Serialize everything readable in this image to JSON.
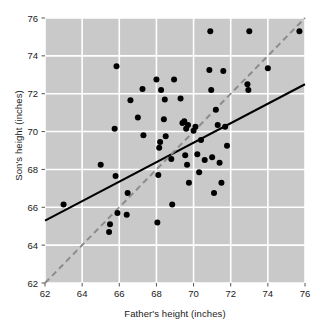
{
  "chart_data": {
    "type": "scatter",
    "title": "",
    "xlabel": "Father's height (inches)",
    "ylabel": "Son's height (inches)",
    "xlim": [
      62,
      76
    ],
    "ylim": [
      62,
      76
    ],
    "xticks": [
      62,
      64,
      66,
      68,
      70,
      72,
      74,
      76
    ],
    "yticks": [
      62,
      64,
      66,
      68,
      70,
      72,
      74,
      76
    ],
    "grid": true,
    "legend": "none",
    "plot_bgcolor": "#c9c9c9",
    "grid_color": "#ffffff",
    "point_color": "#000000",
    "point_radius_px": 3.0,
    "series": [
      {
        "name": "father-son heights",
        "marker": "filled-circle",
        "points": [
          [
            63.0,
            66.15
          ],
          [
            65.0,
            68.25
          ],
          [
            65.45,
            64.7
          ],
          [
            65.5,
            65.1
          ],
          [
            65.75,
            70.15
          ],
          [
            65.8,
            67.65
          ],
          [
            65.85,
            73.45
          ],
          [
            65.9,
            65.7
          ],
          [
            66.4,
            65.6
          ],
          [
            66.45,
            66.75
          ],
          [
            66.6,
            71.65
          ],
          [
            67.0,
            70.75
          ],
          [
            67.25,
            72.25
          ],
          [
            67.3,
            69.8
          ],
          [
            68.0,
            72.75
          ],
          [
            68.05,
            65.2
          ],
          [
            68.1,
            67.7
          ],
          [
            68.15,
            69.15
          ],
          [
            68.2,
            69.45
          ],
          [
            68.25,
            72.2
          ],
          [
            68.4,
            70.65
          ],
          [
            68.45,
            71.7
          ],
          [
            68.5,
            69.75
          ],
          [
            68.8,
            68.55
          ],
          [
            68.85,
            66.15
          ],
          [
            68.95,
            72.75
          ],
          [
            69.3,
            71.75
          ],
          [
            69.4,
            70.45
          ],
          [
            69.5,
            70.55
          ],
          [
            69.55,
            68.75
          ],
          [
            69.6,
            70.15
          ],
          [
            69.65,
            68.25
          ],
          [
            69.7,
            70.35
          ],
          [
            69.75,
            67.3
          ],
          [
            70.0,
            70.05
          ],
          [
            70.1,
            70.25
          ],
          [
            70.2,
            68.8
          ],
          [
            70.3,
            67.85
          ],
          [
            70.4,
            69.55
          ],
          [
            70.6,
            68.5
          ],
          [
            70.85,
            73.25
          ],
          [
            70.9,
            75.3
          ],
          [
            70.95,
            72.2
          ],
          [
            71.0,
            68.65
          ],
          [
            71.1,
            66.75
          ],
          [
            71.2,
            71.15
          ],
          [
            71.3,
            70.35
          ],
          [
            71.4,
            68.35
          ],
          [
            71.5,
            67.3
          ],
          [
            71.6,
            73.2
          ],
          [
            71.7,
            70.25
          ],
          [
            71.8,
            69.25
          ],
          [
            72.9,
            72.5
          ],
          [
            72.95,
            72.2
          ],
          [
            73.0,
            75.3
          ],
          [
            74.0,
            73.35
          ],
          [
            75.7,
            75.3
          ]
        ]
      }
    ],
    "lines": [
      {
        "name": "regression-line",
        "style": "solid",
        "color": "#000000",
        "width_px": 2.0,
        "x0": 62.0,
        "y0": 65.3,
        "x1": 76.0,
        "y1": 72.5
      },
      {
        "name": "identity-line",
        "style": "dashed",
        "color": "#8c8c8c",
        "width_px": 2.0,
        "x0": 62.0,
        "y0": 62.0,
        "x1": 76.0,
        "y1": 76.0
      }
    ]
  }
}
